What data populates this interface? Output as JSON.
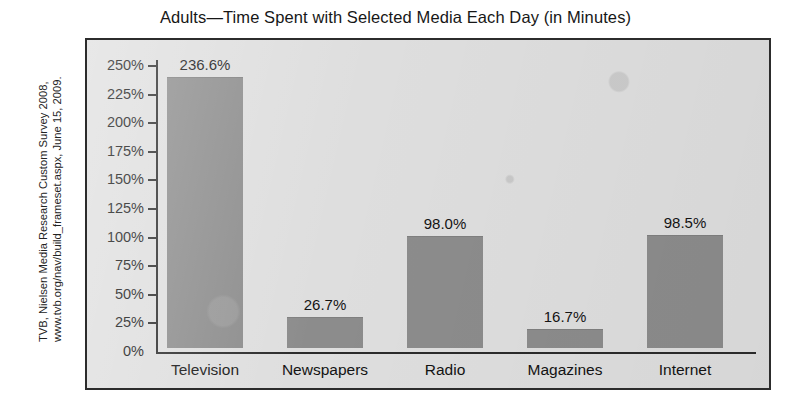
{
  "chart_data": {
    "type": "bar",
    "title": "Adults—Time Spent with Selected Media Each Day (in Minutes)",
    "categories": [
      "Television",
      "Newspapers",
      "Radio",
      "Magazines",
      "Internet"
    ],
    "values": [
      236.6,
      26.7,
      98.0,
      16.7,
      98.5
    ],
    "value_labels": [
      "236.6%",
      "26.7%",
      "98.0%",
      "16.7%",
      "98.5%"
    ],
    "xlabel": "",
    "ylabel": "",
    "ylim": [
      0,
      250
    ],
    "ytick_step": 25,
    "ytick_labels": [
      "250%",
      "225%",
      "200%",
      "175%",
      "150%",
      "125%",
      "100%",
      "75%",
      "50%",
      "25%",
      "0%"
    ],
    "ytick_values": [
      250,
      225,
      200,
      175,
      150,
      125,
      100,
      75,
      50,
      25,
      0
    ],
    "grid": false,
    "legend": false,
    "bar_color": "#8c8c8c",
    "plot_background": "#dedede",
    "axis_color": "#2b2b2b"
  },
  "source": {
    "line1": "TVB, Nielsen Media Research Custom Survey 2008,",
    "line2": "www.tvb.org/nav/build_frameset.aspx, June 15, 2009."
  }
}
